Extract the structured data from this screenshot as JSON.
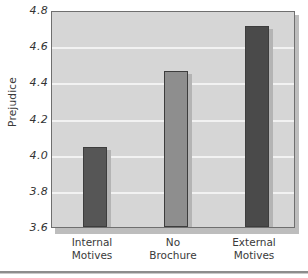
{
  "chart_data": {
    "type": "bar",
    "title": "",
    "subtitle": "",
    "xlabel": "",
    "ylabel": "Prejudice",
    "categories": [
      "Internal Motives",
      "No Brochure",
      "External Motives"
    ],
    "category_lines": [
      [
        "Internal",
        "Motives"
      ],
      [
        "No",
        "Brochure"
      ],
      [
        "External",
        "Motives"
      ]
    ],
    "values": [
      4.04,
      4.46,
      4.71
    ],
    "ylim": [
      3.6,
      4.8
    ],
    "ytick_labels": [
      "4.8",
      "4.6",
      "4.4",
      "4.2",
      "4.0",
      "3.8",
      "3.6"
    ],
    "ytick_values": [
      4.8,
      4.6,
      4.4,
      4.2,
      4.0,
      3.8,
      3.6
    ],
    "grid": true,
    "grid_color": "#f2f2f2",
    "legend": "none",
    "bar_colors": [
      "#565656",
      "#8e8e8e",
      "#4a4a4a"
    ],
    "plot_background": "#d6d6d6",
    "plot_border_color": "#6f6f6f",
    "bar_border_color": "#3d3d3d",
    "bar_shadow_color": "#b4b4b4"
  }
}
